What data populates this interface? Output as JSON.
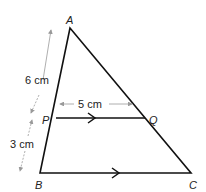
{
  "diagram": {
    "points": {
      "A": {
        "label": "A",
        "x": 70,
        "y": 28
      },
      "B": {
        "label": "B",
        "x": 40,
        "y": 173
      },
      "C": {
        "label": "C",
        "x": 191,
        "y": 173
      },
      "P": {
        "label": "P",
        "x": 56,
        "y": 118
      },
      "Q": {
        "label": "Q",
        "x": 145,
        "y": 118
      }
    },
    "measurements": {
      "AP": "6 cm",
      "PB": "3 cm",
      "PQ": "5 cm"
    },
    "colors": {
      "line": "#111111",
      "dimension": "#999999"
    }
  }
}
